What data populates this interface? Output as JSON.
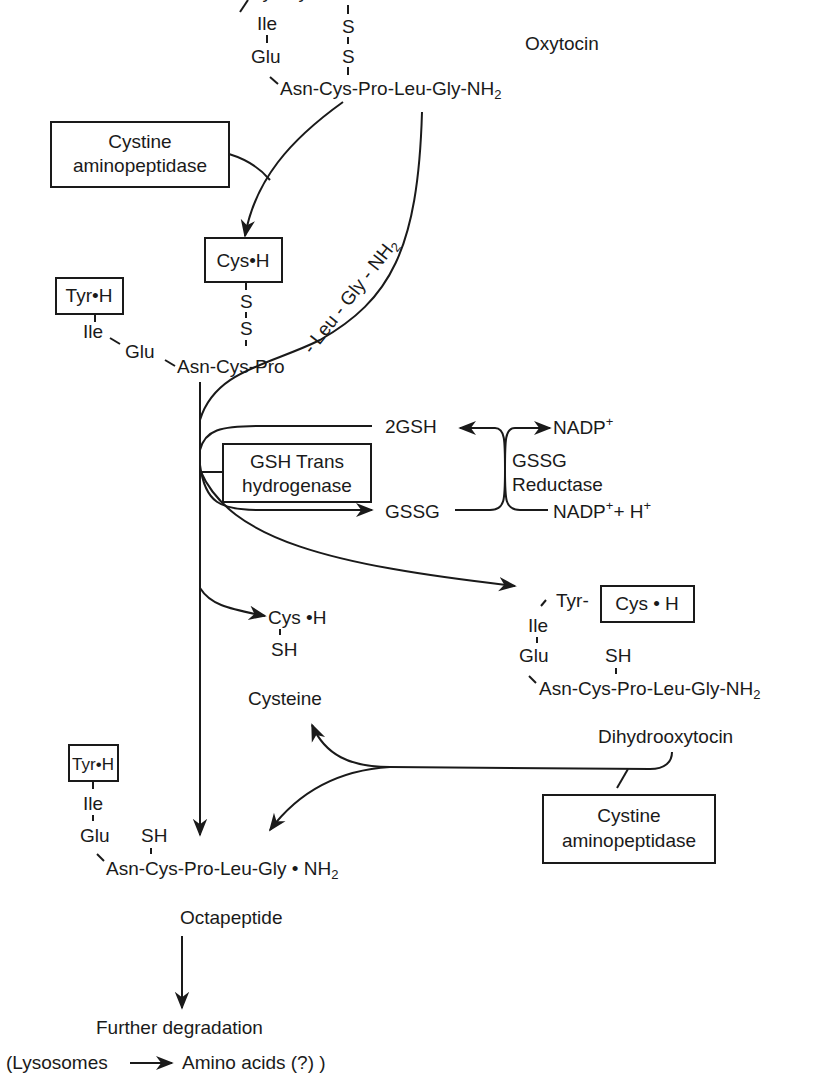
{
  "oxytocin": {
    "label": "Oxytocin",
    "top_chain": "Tyr-Cys•H",
    "ile": "Ile",
    "glu": "Glu",
    "s1": "S",
    "s2": "S",
    "chain": "Asn-Cys-Pro-Leu-Gly-NH",
    "chain_sub": "2"
  },
  "enzymes": {
    "cystine_aminopeptidase_1": {
      "line1": "Cystine",
      "line2": "aminopeptidase"
    },
    "gsh_transhydrogenase": {
      "line1": "GSH Trans",
      "line2": "hydrogenase"
    },
    "gssg_reductase": {
      "line1": "GSSG",
      "line2": "Reductase"
    },
    "cystine_aminopeptidase_2": {
      "line1": "Cystine",
      "line2": "aminopeptidase"
    }
  },
  "intermediate": {
    "cys_box": "Cys•H",
    "tyr_box": "Tyr•H",
    "ile": "Ile",
    "glu": "Glu",
    "s1": "S",
    "s2": "S",
    "chain": "Asn-Cys-Pro",
    "released_fragment": "- Leu - Gly - NH",
    "released_fragment_sub": "2"
  },
  "redox": {
    "gsh": "2GSH",
    "gssg": "GSSG",
    "nadp": "NADP",
    "nadp_sup": "+",
    "nadp_h": "NADP",
    "nadp_h_sup": "+",
    "nadp_h_rest": "+ H",
    "nadp_h_sup2": "+"
  },
  "cysteine_product": {
    "cys": "Cys •H",
    "sh": "SH",
    "label": "Cysteine"
  },
  "dihydrooxytocin": {
    "tyr": "Tyr-",
    "cys_box": "Cys • H",
    "ile": "Ile",
    "glu": "Glu",
    "sh": "SH",
    "chain": "Asn-Cys-Pro-Leu-Gly-NH",
    "chain_sub": "2",
    "label": "Dihydrooxytocin"
  },
  "octapeptide": {
    "tyr_box": "Tyr•H",
    "ile": "Ile",
    "glu": "Glu",
    "sh": "SH",
    "chain": "Asn-Cys-Pro-Leu-Gly • NH",
    "chain_sub": "2",
    "label": "Octapeptide"
  },
  "final": {
    "line1": "Further degradation",
    "lysosomes": "(Lysosomes",
    "amino_acids": "Amino acids (?) )"
  }
}
